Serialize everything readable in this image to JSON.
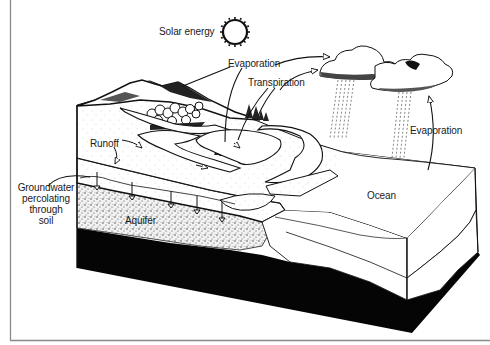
{
  "diagram": {
    "labels": {
      "solar_energy": "Solar energy",
      "evaporation_top": "Evaporation",
      "transpiration": "Transpiration",
      "evaporation_ocean": "Evaporation",
      "runoff": "Runoff",
      "groundwater": [
        "Groundwater",
        "percolating",
        "through",
        "soil"
      ],
      "aquifer": "Aquifer",
      "ocean": "Ocean"
    },
    "icons": {
      "sun": "sun-icon",
      "cloud": "cloud-icon",
      "rain": "rain-icon",
      "arrow": "arrow-icon"
    },
    "colors": {
      "ink": "#111111",
      "bedrock": "#050505",
      "paper": "#ffffff",
      "frame": "#8a8a8a",
      "stipple": "#777777"
    }
  }
}
